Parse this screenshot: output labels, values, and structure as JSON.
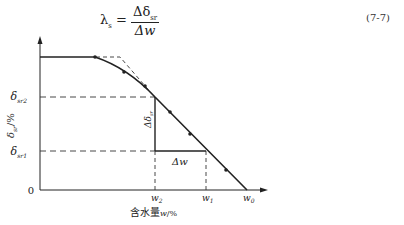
{
  "formula": {
    "lhs": "λ",
    "lhs_sub": "s",
    "equals": "=",
    "numerator": "Δδ",
    "numerator_sub": "sr",
    "denominator": "Δw",
    "equation_number": "(7-7)"
  },
  "diagram": {
    "y_axis_label": "δ",
    "y_axis_label_sub": "sr",
    "y_axis_label_unit": "/%",
    "x_axis_label_cn": "含水量",
    "x_axis_label_var": "w",
    "x_axis_label_unit": "/%",
    "origin_label": "0",
    "y_ticks": [
      {
        "label": "δ",
        "sub": "sr2"
      },
      {
        "label": "δ",
        "sub": "sr1"
      }
    ],
    "x_ticks": [
      {
        "label": "w",
        "sub": "2"
      },
      {
        "label": "w",
        "sub": "1"
      },
      {
        "label": "w",
        "sub": "0"
      }
    ],
    "delta_delta_label": "Δδ",
    "delta_delta_sub": "sr",
    "delta_w_label": "Δw"
  }
}
